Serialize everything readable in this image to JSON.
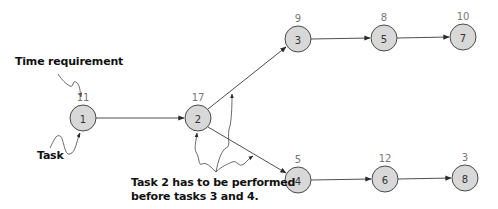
{
  "diagram": {
    "type": "task-dependency-network",
    "colors": {
      "node_fill": "#d8d8d8",
      "node_stroke": "#4a4a4a",
      "time_label": "#777777",
      "annotation_text": "#111111"
    },
    "nodes": [
      {
        "id": "1",
        "label": "1",
        "time": "11",
        "cx": 83,
        "cy": 118
      },
      {
        "id": "2",
        "label": "2",
        "time": "17",
        "cx": 198,
        "cy": 118
      },
      {
        "id": "3",
        "label": "3",
        "time": "9",
        "cx": 298,
        "cy": 39
      },
      {
        "id": "5",
        "label": "5",
        "time": "8",
        "cx": 384,
        "cy": 38
      },
      {
        "id": "7",
        "label": "7",
        "time": "10",
        "cx": 463,
        "cy": 37
      },
      {
        "id": "4",
        "label": "4",
        "time": "5",
        "cx": 298,
        "cy": 180
      },
      {
        "id": "6",
        "label": "6",
        "time": "12",
        "cx": 385,
        "cy": 179
      },
      {
        "id": "8",
        "label": "8",
        "time": "3",
        "cx": 465,
        "cy": 178
      }
    ],
    "edges": [
      {
        "from": "1",
        "to": "2"
      },
      {
        "from": "2",
        "to": "3"
      },
      {
        "from": "2",
        "to": "4"
      },
      {
        "from": "3",
        "to": "5"
      },
      {
        "from": "5",
        "to": "7"
      },
      {
        "from": "4",
        "to": "6"
      },
      {
        "from": "6",
        "to": "8"
      }
    ],
    "annotations": {
      "time_requirement": "Time requirement",
      "task": "Task",
      "dependency_line1": "Task 2 has to be performed",
      "dependency_line2": "before tasks 3 and 4."
    }
  }
}
